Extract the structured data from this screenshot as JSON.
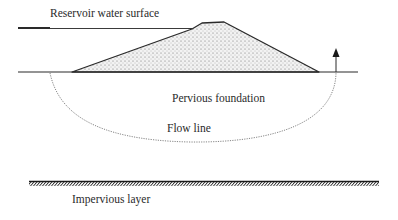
{
  "diagram": {
    "type": "earth-dam seepage cross-section",
    "labels": {
      "reservoir": "Reservoir water surface",
      "foundation": "Pervious foundation",
      "flow_line": "Flow line",
      "impervious": "Impervious layer"
    },
    "colors": {
      "line": "#2a2a2a",
      "dam_fill": "#e6e6e6",
      "flow_line": "#777777",
      "background": "#ffffff"
    }
  }
}
